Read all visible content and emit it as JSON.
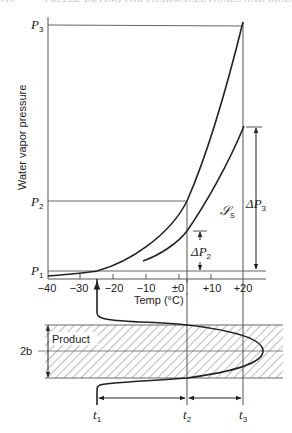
{
  "page_header": {
    "page_number": "116",
    "running_title": "FREEZE-DRYING FOR PHARMACEUTICALS AND BIOLOGICALS"
  },
  "diagram": {
    "y_axis_label": "Water vapor pressure",
    "x_axis_label": "Temp (°C)",
    "x_ticks": [
      "−40",
      "−30",
      "−20",
      "−10",
      "±0",
      "+10",
      "+20"
    ],
    "pressure_levels": [
      {
        "symbol": "P",
        "sub": "1"
      },
      {
        "symbol": "P",
        "sub": "2"
      },
      {
        "symbol": "P",
        "sub": "3"
      }
    ],
    "delta_labels": [
      {
        "symbol": "ΔP",
        "sub": "2"
      },
      {
        "symbol": "ΔP",
        "sub": "3"
      }
    ],
    "curve_label": {
      "symbol": "𝒮",
      "sub": "S"
    },
    "product_label": "Product",
    "thickness_label": "2b",
    "time_labels": [
      {
        "symbol": "t",
        "sub": "1"
      },
      {
        "symbol": "t",
        "sub": "2"
      },
      {
        "symbol": "t",
        "sub": "3"
      }
    ]
  }
}
